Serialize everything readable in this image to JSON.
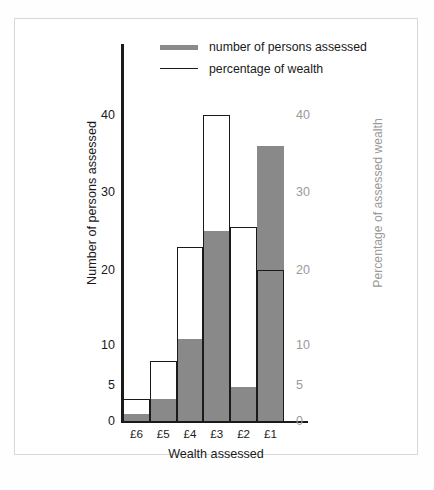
{
  "chart_data": {
    "type": "bar",
    "title": "",
    "xlabel": "Wealth assessed",
    "ylabel": "Number of persons assessed",
    "y2label": "Percentage of assessed wealth",
    "categories": [
      "£6",
      "£5",
      "£4",
      "£3",
      "£2",
      "£1"
    ],
    "series": [
      {
        "name": "number of persons assessed",
        "axis": "left",
        "style": "filled-gray-bar",
        "color": "#898989",
        "values": [
          1,
          3,
          10.8,
          25,
          4.7,
          36
        ]
      },
      {
        "name": "percentage of wealth",
        "axis": "right",
        "style": "open-outline-bar",
        "color": "#1a1a1a",
        "values": [
          3,
          8,
          23,
          40,
          25.5,
          20
        ]
      }
    ],
    "yticks": [
      0,
      5,
      10,
      20,
      30,
      40
    ],
    "y2ticks": [
      0,
      5,
      10,
      20,
      30,
      40
    ],
    "ylim": [
      0,
      44
    ],
    "y2lim": [
      0,
      44
    ],
    "grid": false,
    "legend_position": "top-center",
    "scale_note": "non-linear tick spacing: 0-5-10 compressed relative to 10-20-30-40"
  },
  "legend": {
    "items": [
      {
        "label": "number of persons assessed",
        "key": "thick-gray-line-swatch"
      },
      {
        "label": "percentage of wealth",
        "key": "thin-black-line-swatch"
      }
    ]
  },
  "axes": {
    "left_title": "Number of persons assessed",
    "right_title": "Percentage of assessed wealth",
    "bottom_title": "Wealth assessed"
  },
  "colors": {
    "bar_gray": "#898989",
    "outline_black": "#1a1a1a",
    "right_axis_gray": "#9a9a9a",
    "frame_border": "#d8d8d8",
    "background": "#ffffff"
  },
  "caption": ""
}
